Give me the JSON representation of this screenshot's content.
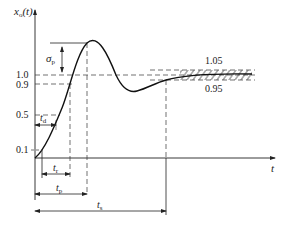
{
  "diagram": {
    "y_axis_label": "x",
    "y_axis_sub": "o",
    "y_axis_arg": "(t)",
    "x_axis_label": "t",
    "levels": {
      "l10": "1.0",
      "l09": "0.9",
      "l05": "0.5",
      "l01": "0.1"
    },
    "band": {
      "upper": "1.05",
      "lower": "0.95"
    },
    "overshoot": {
      "sym": "σ",
      "sub": "p"
    },
    "times": {
      "td": {
        "sym": "t",
        "sub": "d"
      },
      "tr": {
        "sym": "t",
        "sub": "r"
      },
      "tp": {
        "sym": "t",
        "sub": "p"
      },
      "ts": {
        "sym": "t",
        "sub": "s"
      }
    },
    "colors": {
      "line": "#222222",
      "background": "#ffffff"
    }
  }
}
